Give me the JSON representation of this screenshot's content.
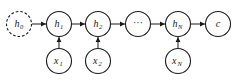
{
  "diagram": {
    "type": "rnn-unrolled-encoder",
    "colors": {
      "stroke": "#1a1a1a",
      "background": "#ffffff",
      "node_fill": "#ffffff"
    },
    "nodes": [
      {
        "id": "h0",
        "base": "h",
        "sub": "0",
        "style": "dashed",
        "row": "hidden"
      },
      {
        "id": "h1",
        "base": "h",
        "sub": "1",
        "style": "solid",
        "row": "hidden"
      },
      {
        "id": "h2",
        "base": "h",
        "sub": "2",
        "style": "solid",
        "row": "hidden"
      },
      {
        "id": "dots",
        "base": "···",
        "sub": "",
        "style": "solid",
        "row": "hidden"
      },
      {
        "id": "hN",
        "base": "h",
        "sub": "N",
        "style": "solid",
        "row": "hidden"
      },
      {
        "id": "c",
        "base": "c",
        "sub": "",
        "style": "solid",
        "row": "hidden"
      },
      {
        "id": "x1",
        "base": "x",
        "sub": "1",
        "style": "solid",
        "row": "input"
      },
      {
        "id": "x2",
        "base": "x",
        "sub": "2",
        "style": "solid",
        "row": "input"
      },
      {
        "id": "xN",
        "base": "x",
        "sub": "N",
        "style": "solid",
        "row": "input"
      }
    ],
    "edges": [
      {
        "from": "h0",
        "to": "h1"
      },
      {
        "from": "h1",
        "to": "h2"
      },
      {
        "from": "h2",
        "to": "dots"
      },
      {
        "from": "dots",
        "to": "hN"
      },
      {
        "from": "hN",
        "to": "c"
      },
      {
        "from": "x1",
        "to": "h1"
      },
      {
        "from": "x2",
        "to": "h2"
      },
      {
        "from": "xN",
        "to": "hN"
      }
    ]
  },
  "labels": {
    "h0": {
      "base": "h",
      "sub": "0"
    },
    "h1": {
      "base": "h",
      "sub": "1"
    },
    "h2": {
      "base": "h",
      "sub": "2"
    },
    "dots": {
      "base": "···"
    },
    "hN": {
      "base": "h",
      "sub": "N"
    },
    "c": {
      "base": "c"
    },
    "x1": {
      "base": "x",
      "sub": "1"
    },
    "x2": {
      "base": "x",
      "sub": "2"
    },
    "xN": {
      "base": "x",
      "sub": "N"
    }
  }
}
